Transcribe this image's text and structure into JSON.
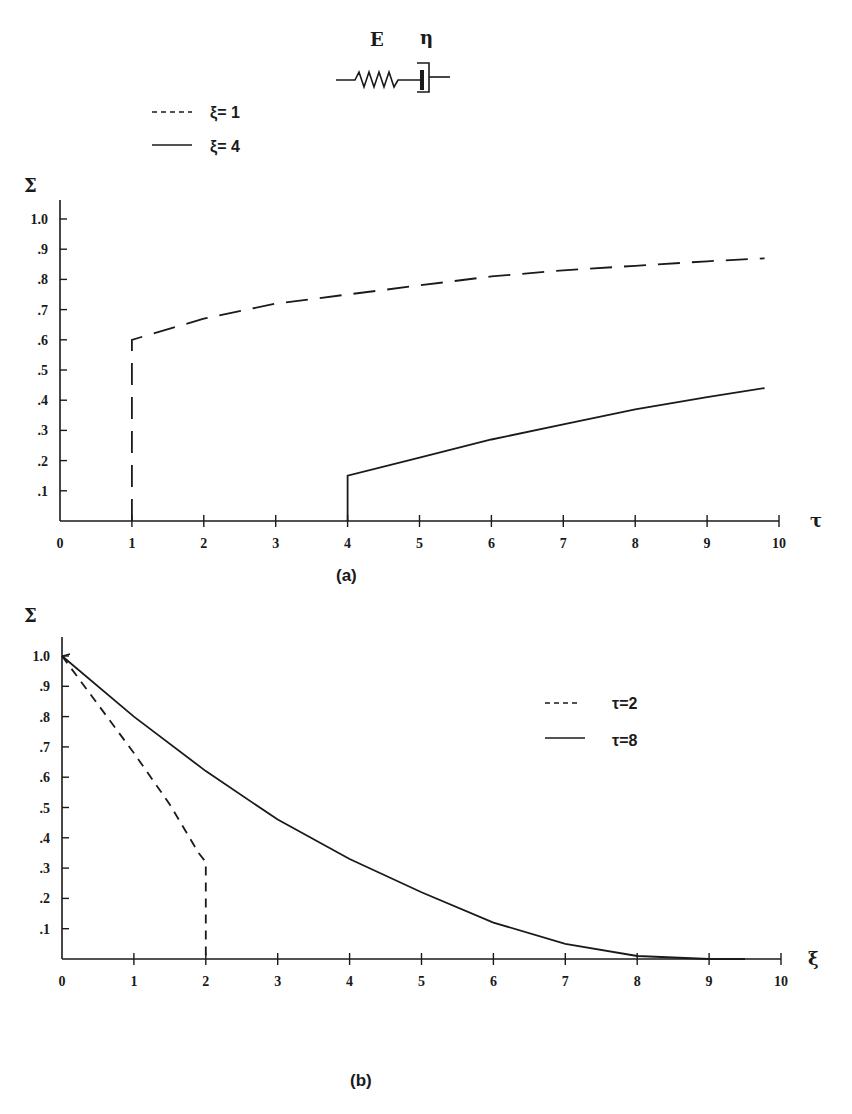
{
  "model_diagram": {
    "spring_label": "E",
    "dashpot_label": "η"
  },
  "colors": {
    "ink": "#1a1a1a",
    "background": "#ffffff"
  },
  "chart_data": [
    {
      "id": "a",
      "type": "line",
      "caption": "(a)",
      "xlabel": "τ",
      "ylabel": "Σ",
      "xlim": [
        0,
        10
      ],
      "ylim": [
        0,
        1.0
      ],
      "x_ticks": [
        "0",
        "1",
        "2",
        "3",
        "4",
        "5",
        "6",
        "7",
        "8",
        "9",
        "10"
      ],
      "y_ticks": [
        "1.0",
        ".9",
        ".8",
        ".7",
        ".6",
        ".5",
        ".4",
        ".3",
        ".2",
        ".1"
      ],
      "grid": false,
      "legend_position": "top-left",
      "series": [
        {
          "name": "ξ= 1",
          "style": "dashed",
          "x": [
            1,
            1,
            2,
            3,
            4,
            5,
            6,
            7,
            8,
            9,
            9.8
          ],
          "y": [
            0,
            0.6,
            0.67,
            0.72,
            0.75,
            0.78,
            0.81,
            0.83,
            0.845,
            0.86,
            0.87
          ]
        },
        {
          "name": "ξ= 4",
          "style": "solid",
          "x": [
            4,
            4,
            5,
            6,
            7,
            8,
            9,
            9.8
          ],
          "y": [
            0,
            0.15,
            0.21,
            0.27,
            0.32,
            0.37,
            0.41,
            0.44
          ]
        }
      ]
    },
    {
      "id": "b",
      "type": "line",
      "caption": "(b)",
      "xlabel": "ξ",
      "ylabel": "Σ",
      "xlim": [
        0,
        10
      ],
      "ylim": [
        0,
        1.0
      ],
      "x_ticks": [
        "0",
        "1",
        "2",
        "3",
        "4",
        "5",
        "6",
        "7",
        "8",
        "9",
        "10"
      ],
      "y_ticks": [
        "1.0",
        ".9",
        ".8",
        ".7",
        ".6",
        ".5",
        ".4",
        ".3",
        ".2",
        ".1"
      ],
      "grid": false,
      "legend_position": "upper-right",
      "series": [
        {
          "name": "τ=2",
          "style": "dashed",
          "x": [
            0,
            0.5,
            1,
            1.5,
            1.9,
            2,
            2
          ],
          "y": [
            1.0,
            0.84,
            0.68,
            0.51,
            0.35,
            0.32,
            0
          ]
        },
        {
          "name": "τ=8",
          "style": "solid",
          "x": [
            0,
            1,
            2,
            3,
            4,
            5,
            6,
            7,
            8,
            9,
            9.5
          ],
          "y": [
            1.0,
            0.8,
            0.62,
            0.46,
            0.33,
            0.22,
            0.12,
            0.05,
            0.01,
            0.0,
            0.0
          ]
        }
      ]
    }
  ]
}
